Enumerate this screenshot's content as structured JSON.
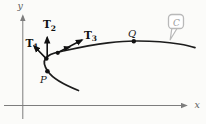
{
  "figure": {
    "axis": {
      "x_label": "x",
      "y_label": "y"
    },
    "points": {
      "p_label": "P",
      "q_label": "Q"
    },
    "vectors": [
      {
        "base": "T",
        "sub": "1"
      },
      {
        "base": "T",
        "sub": "2"
      },
      {
        "base": "T",
        "sub": "3"
      }
    ],
    "curve_label": "C",
    "colors": {
      "background": "#fbfbf9",
      "curve": "#1c1c1c",
      "vector": "#111111",
      "axis": "#7d7d7d",
      "point_label": "#1b1b1b",
      "axis_label": "#606060",
      "callout_border": "#b9b9b9",
      "callout_text": "#9c9c9c"
    }
  }
}
